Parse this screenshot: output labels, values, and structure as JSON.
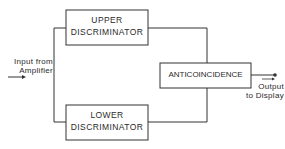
{
  "diagram": {
    "type": "block-diagram",
    "nodes": [
      {
        "id": "upper",
        "lines": [
          "UPPER",
          "DISCRIMINATOR"
        ]
      },
      {
        "id": "lower",
        "lines": [
          "LOWER",
          "DISCRIMINATOR"
        ]
      },
      {
        "id": "anti",
        "lines": [
          "ANTICOINCIDENCE"
        ]
      }
    ],
    "input": {
      "lines": [
        "Input from",
        "Amplifier"
      ]
    },
    "output": {
      "lines": [
        "Output",
        "to Display"
      ]
    },
    "edges": [
      {
        "from": "input",
        "to": "upper"
      },
      {
        "from": "input",
        "to": "lower"
      },
      {
        "from": "upper",
        "to": "anti"
      },
      {
        "from": "lower",
        "to": "anti"
      },
      {
        "from": "anti",
        "to": "output"
      }
    ],
    "colors": {
      "stroke": "#333333",
      "background": "#ffffff"
    }
  }
}
